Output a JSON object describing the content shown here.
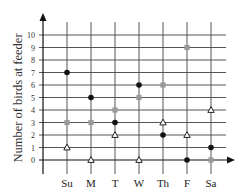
{
  "chart_data": {
    "type": "scatter",
    "title": "",
    "xlabel": "",
    "ylabel": "Number of birds at feeder",
    "categories": [
      "Su",
      "M",
      "T",
      "W",
      "Th",
      "F",
      "Sa"
    ],
    "ylim": [
      0,
      10
    ],
    "yticks": [
      0,
      1,
      2,
      3,
      4,
      5,
      6,
      7,
      8,
      9,
      10
    ],
    "grid": true,
    "legend": null,
    "series": [
      {
        "name": "black-circle",
        "marker": "circle",
        "color": "#111111",
        "values": [
          7,
          5,
          3,
          6,
          2,
          0,
          1
        ]
      },
      {
        "name": "gray-square",
        "marker": "square",
        "color": "#999999",
        "values": [
          3,
          3,
          4,
          5,
          6,
          9,
          0
        ]
      },
      {
        "name": "white-triangle",
        "marker": "triangle",
        "color": "#ffffff",
        "values": [
          1,
          0,
          2,
          0,
          3,
          2,
          4
        ]
      }
    ]
  },
  "colors": {
    "grid": "#555555",
    "axis": "#111111"
  }
}
